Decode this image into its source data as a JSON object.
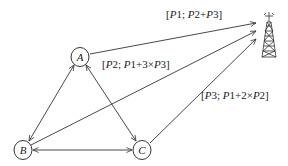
{
  "diagram": {
    "nodes": [
      {
        "id": "A",
        "label": "A"
      },
      {
        "id": "B",
        "label": "B"
      },
      {
        "id": "C",
        "label": "C"
      }
    ],
    "tower": {
      "icon": "cell-tower-icon"
    },
    "edges": [
      {
        "from": "A",
        "to": "B",
        "direction": "both"
      },
      {
        "from": "A",
        "to": "C",
        "direction": "both"
      },
      {
        "from": "B",
        "to": "C",
        "direction": "both"
      },
      {
        "from": "A",
        "to": "tower",
        "direction": "forward"
      },
      {
        "from": "B",
        "to": "tower",
        "direction": "forward"
      },
      {
        "from": "C",
        "to": "tower",
        "direction": "forward"
      }
    ],
    "labels": {
      "a_tower": {
        "open": "[",
        "p_a": "P",
        "n_a": "1",
        "sep": "; ",
        "p_b": "P",
        "n_b": "2",
        "op": "+",
        "p_c": "P",
        "n_c": "3",
        "close": "]"
      },
      "b_tower": {
        "open": "[",
        "p_a": "P",
        "n_a": "2",
        "sep": "; ",
        "p_b": "P",
        "n_b": "1",
        "op": "+3×",
        "p_c": "P",
        "n_c": "3",
        "close": "]"
      },
      "c_tower": {
        "open": "[",
        "p_a": "P",
        "n_a": "3",
        "sep": "; ",
        "p_b": "P",
        "n_b": "1",
        "op": "+2×",
        "p_c": "P",
        "n_c": "2",
        "close": "]"
      }
    },
    "colors": {
      "stroke": "#333333",
      "text": "#222222",
      "background": "#ffffff"
    }
  }
}
